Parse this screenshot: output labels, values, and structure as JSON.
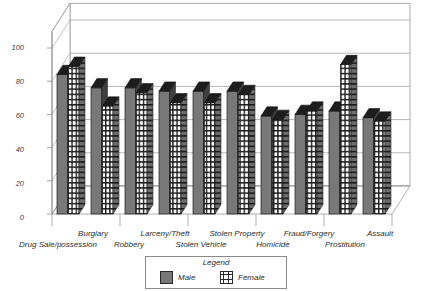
{
  "chart_data": {
    "type": "bar",
    "title": "percentage testing positive for any drug",
    "xlabel": "",
    "ylabel": "",
    "ylim": [
      0,
      110
    ],
    "yticks": [
      0,
      20,
      40,
      60,
      80,
      100
    ],
    "grid": true,
    "legend_position": "bottom-center",
    "legend_title": "Legend",
    "categories": [
      "Drug Sale/possession",
      "Burglary",
      "Robbery",
      "Larceny/Theft",
      "Stolen Vehicle",
      "Stolen Property",
      "Homicide",
      "Fraud/Forgery",
      "Prostitution",
      "Assault"
    ],
    "series": [
      {
        "name": "Male",
        "color": "#787878",
        "values": [
          84,
          76,
          76,
          74,
          74,
          74,
          59,
          60,
          62,
          58
        ]
      },
      {
        "name": "Female",
        "color": "#ffffff",
        "values": [
          89,
          65,
          73,
          67,
          67,
          72,
          57,
          62,
          90,
          56
        ]
      }
    ]
  },
  "axis": {
    "tick_labels": [
      "100",
      "80",
      "60",
      "40",
      "20",
      "0"
    ]
  },
  "category_labels_top": [
    "Burglary",
    "Larceny/Theft",
    "Stolen Property",
    "Fraud/Forgery",
    "Assault"
  ],
  "category_labels_bottom": [
    "Drug Sale/possession",
    "Robbery",
    "Stolen Vehicle",
    "Homicide",
    "Prostitution"
  ],
  "legend": {
    "title": "Legend",
    "items": [
      {
        "label": "Male"
      },
      {
        "label": "Female"
      }
    ]
  }
}
